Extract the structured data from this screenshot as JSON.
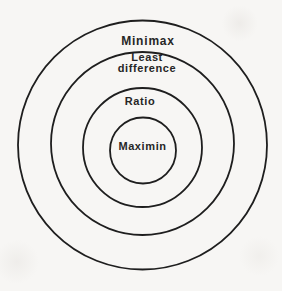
{
  "figure": {
    "type": "concentric-circles-diagram",
    "background_color": "#f7f6f4",
    "line_color": "#1e1e1e",
    "text_color": "#262626",
    "rings": [
      {
        "position": "outermost",
        "label": "Minimax"
      },
      {
        "position": "second",
        "label": "Least difference",
        "label_line1": "Least",
        "label_line2": "difference"
      },
      {
        "position": "third",
        "label": "Ratio"
      },
      {
        "position": "innermost",
        "label": "Maximin"
      }
    ]
  }
}
